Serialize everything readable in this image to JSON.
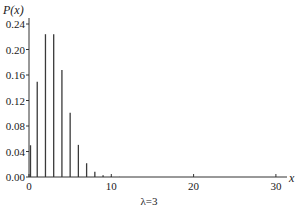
{
  "chart_data": {
    "type": "bar",
    "title": "",
    "xlabel": "x",
    "ylabel": "P(x)",
    "annotation": "λ=3",
    "xlim": [
      0,
      31
    ],
    "ylim": [
      0,
      0.24
    ],
    "x_ticks": [
      0,
      10,
      20,
      30
    ],
    "y_ticks": [
      0.0,
      0.04,
      0.08,
      0.12,
      0.16,
      0.2,
      0.24
    ],
    "y_tick_labels": [
      "0.00",
      "0.04",
      "0.08",
      "0.12",
      "0.16",
      "0.20",
      "0.24"
    ],
    "x_tick_labels": [
      "0",
      "10",
      "20",
      "30"
    ],
    "grid": false,
    "series": [
      {
        "name": "Poisson λ=3",
        "x": [
          0,
          1,
          2,
          3,
          4,
          5,
          6,
          7,
          8,
          9,
          10,
          11
        ],
        "values": [
          0.0498,
          0.1494,
          0.224,
          0.224,
          0.168,
          0.1008,
          0.0504,
          0.0216,
          0.0081,
          0.0027,
          0.0008,
          0.0002
        ]
      }
    ],
    "bar_color": "#3a3a3a"
  }
}
